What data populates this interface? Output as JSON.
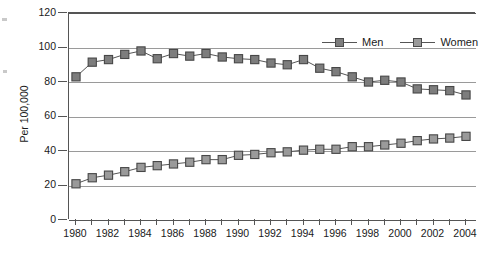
{
  "chart_data": {
    "type": "line",
    "title": "",
    "xlabel": "",
    "ylabel": "Per 100,000",
    "xlim": [
      1980,
      2004
    ],
    "ylim": [
      0,
      120
    ],
    "ytick_values": [
      0,
      20,
      40,
      60,
      80,
      100,
      120
    ],
    "ytick_labels": [
      "0",
      "20",
      "40",
      "60",
      "80",
      "100",
      "120"
    ],
    "xtick_values": [
      1980,
      1982,
      1984,
      1986,
      1988,
      1990,
      1992,
      1994,
      1996,
      1998,
      2000,
      2002,
      2004
    ],
    "xtick_labels": [
      "1980",
      "1982",
      "1984",
      "1986",
      "1988",
      "1990",
      "1992",
      "1994",
      "1996",
      "1998",
      "2000",
      "2002",
      "2004"
    ],
    "x": [
      1980,
      1981,
      1982,
      1983,
      1984,
      1985,
      1986,
      1987,
      1988,
      1989,
      1990,
      1991,
      1992,
      1993,
      1994,
      1995,
      1996,
      1997,
      1998,
      1999,
      2000,
      2001,
      2002,
      2003,
      2004
    ],
    "grid": "horizontal",
    "legend_position": "top-right",
    "series": [
      {
        "name": "Men",
        "color": "#7d7d7d",
        "values": [
          83,
          91.5,
          93,
          96,
          98,
          93.5,
          96.5,
          95,
          96.5,
          94.5,
          93.5,
          93,
          91,
          90,
          93,
          88,
          86,
          83,
          80,
          81,
          80,
          76,
          75.5,
          75,
          72.5
        ]
      },
      {
        "name": "Women",
        "color": "#9a9a9a",
        "values": [
          21,
          24.5,
          26,
          28,
          30.5,
          31.5,
          32.5,
          33.5,
          35,
          35,
          37.5,
          38,
          39,
          39.5,
          40.5,
          41,
          41,
          42.5,
          42.5,
          43.5,
          44.5,
          46,
          47,
          47.5,
          48.5
        ]
      }
    ]
  },
  "legend": {
    "items": [
      {
        "label": "Men"
      },
      {
        "label": "Women"
      }
    ]
  }
}
